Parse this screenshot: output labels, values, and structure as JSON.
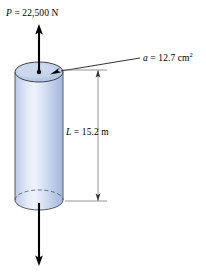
{
  "figure": {
    "background_color": "#ffffff",
    "line_color": "#000000",
    "cylinder": {
      "body_fill_light": "#e8eef8",
      "body_fill_mid": "#c3d2ea",
      "body_fill_dark": "#a8bcdd",
      "top_face_fill": "#c6d4ec",
      "outline_color": "#3a3a4a",
      "hidden_edge_style": "dashed"
    },
    "labels": {
      "load": {
        "symbol": "P",
        "equals": " = ",
        "value": "22,500",
        "unit": " N",
        "full": "P = 22,500 N"
      },
      "area": {
        "symbol": "a",
        "equals": " = ",
        "value": "12.7",
        "unit": " cm",
        "exponent": "2",
        "full": "a = 12.7 cm2"
      },
      "length": {
        "symbol": "L",
        "equals": " = ",
        "value": "15.2",
        "unit": " m",
        "full": "L = 15.2 m"
      }
    },
    "arrows": {
      "top_force_direction": "up",
      "bottom_force_direction": "down",
      "leader_target": "top-face",
      "dimension_arrow_style": "double-ended"
    }
  }
}
